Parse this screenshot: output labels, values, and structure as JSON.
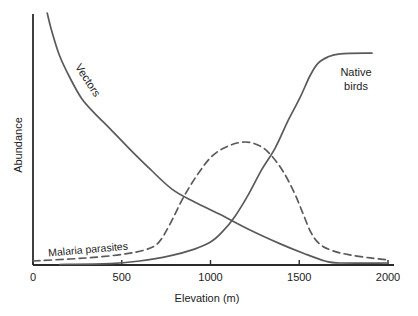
{
  "figure": {
    "background": "#ffffff",
    "axis_color": "#2b2b2b",
    "curve_color": "#5a5a5a",
    "text_color": "#1c1c1c"
  },
  "labels": {
    "ylabel": "Abundance",
    "xlabel": "Elevation (m)",
    "vectors": "Vectors",
    "native_line1": "Native",
    "native_line2": "birds",
    "malaria": "Malaria parasites"
  },
  "chart_data": {
    "type": "line",
    "title": "",
    "xlabel": "Elevation (m)",
    "ylabel": "Abundance",
    "xlim": [
      0,
      2000
    ],
    "ylim": [
      0,
      1
    ],
    "x_ticks": [
      0,
      500,
      1000,
      1500,
      2000
    ],
    "x_tick_labels": [
      "0",
      "500",
      "1000",
      "1500",
      "2000"
    ],
    "y_ticks": [],
    "grid": false,
    "legend_position": "inline-annotations",
    "series": [
      {
        "name": "Vectors",
        "style": "solid",
        "points": [
          [
            80,
            1.0
          ],
          [
            105,
            0.93
          ],
          [
            150,
            0.83
          ],
          [
            210,
            0.74
          ],
          [
            275,
            0.66
          ],
          [
            350,
            0.6
          ],
          [
            435,
            0.54
          ],
          [
            545,
            0.46
          ],
          [
            660,
            0.38
          ],
          [
            785,
            0.3
          ],
          [
            910,
            0.25
          ],
          [
            1055,
            0.2
          ],
          [
            1220,
            0.14
          ],
          [
            1390,
            0.085
          ],
          [
            1530,
            0.045
          ],
          [
            1645,
            0.016
          ],
          [
            1730,
            0.008
          ],
          [
            2000,
            0.008
          ]
        ]
      },
      {
        "name": "Native birds",
        "style": "solid",
        "points": [
          [
            150,
            0.002
          ],
          [
            435,
            0.005
          ],
          [
            600,
            0.016
          ],
          [
            770,
            0.036
          ],
          [
            910,
            0.063
          ],
          [
            1000,
            0.091
          ],
          [
            1065,
            0.13
          ],
          [
            1140,
            0.195
          ],
          [
            1210,
            0.275
          ],
          [
            1290,
            0.38
          ],
          [
            1365,
            0.465
          ],
          [
            1435,
            0.57
          ],
          [
            1505,
            0.665
          ],
          [
            1560,
            0.75
          ],
          [
            1605,
            0.8
          ],
          [
            1660,
            0.825
          ],
          [
            1730,
            0.838
          ],
          [
            1910,
            0.841
          ]
        ]
      },
      {
        "name": "Malaria parasites",
        "style": "dashed",
        "points": [
          [
            0,
            0.016
          ],
          [
            210,
            0.024
          ],
          [
            375,
            0.032
          ],
          [
            520,
            0.044
          ],
          [
            630,
            0.06
          ],
          [
            705,
            0.087
          ],
          [
            770,
            0.16
          ],
          [
            845,
            0.265
          ],
          [
            925,
            0.357
          ],
          [
            1010,
            0.433
          ],
          [
            1100,
            0.472
          ],
          [
            1195,
            0.488
          ],
          [
            1280,
            0.472
          ],
          [
            1345,
            0.433
          ],
          [
            1410,
            0.37
          ],
          [
            1470,
            0.29
          ],
          [
            1520,
            0.206
          ],
          [
            1565,
            0.13
          ],
          [
            1615,
            0.083
          ],
          [
            1690,
            0.056
          ],
          [
            1785,
            0.04
          ],
          [
            1900,
            0.028
          ],
          [
            2000,
            0.02
          ]
        ]
      }
    ],
    "annotations": [
      {
        "text": "Vectors",
        "rotation_deg": 57
      },
      {
        "text": "Native birds",
        "rotation_deg": 0
      },
      {
        "text": "Malaria parasites",
        "rotation_deg": -5
      }
    ]
  }
}
